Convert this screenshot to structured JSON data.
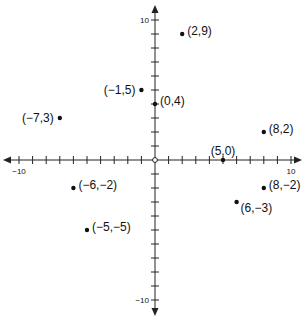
{
  "chart_data": {
    "type": "scatter",
    "title": "",
    "xlabel": "",
    "ylabel": "",
    "xlim": [
      -10,
      10
    ],
    "ylim": [
      -10,
      10
    ],
    "grid": false,
    "tick_step": 1,
    "axis_tick_labels": {
      "x": [
        {
          "value": -10,
          "label": "−10"
        },
        {
          "value": 10,
          "label": "10"
        }
      ],
      "y": [
        {
          "value": 10,
          "label": "10"
        },
        {
          "value": -10,
          "label": "−10"
        }
      ]
    },
    "origin_marker": "open-circle",
    "points": [
      {
        "x": 2,
        "y": 9,
        "label": "(2,9)",
        "label_side": "right"
      },
      {
        "x": -1,
        "y": 5,
        "label": "(−1,5)",
        "label_side": "left"
      },
      {
        "x": 0,
        "y": 4,
        "label": "(0,4)",
        "label_side": "right"
      },
      {
        "x": -7,
        "y": 3,
        "label": "(−7,3)",
        "label_side": "left"
      },
      {
        "x": 8,
        "y": 2,
        "label": "(8,2)",
        "label_side": "right"
      },
      {
        "x": 5,
        "y": 0,
        "label": "(5,0)",
        "label_side": "above"
      },
      {
        "x": -6,
        "y": -2,
        "label": "(−6,−2)",
        "label_side": "right"
      },
      {
        "x": 8,
        "y": -2,
        "label": "(8,−2)",
        "label_side": "right"
      },
      {
        "x": 6,
        "y": -3,
        "label": "(6,−3)",
        "label_side": "right-below"
      },
      {
        "x": -5,
        "y": -5,
        "label": "(−5,−5)",
        "label_side": "right"
      }
    ]
  },
  "style": {
    "axis_color": "#222222",
    "point_color": "#111111",
    "background": "#ffffff"
  }
}
